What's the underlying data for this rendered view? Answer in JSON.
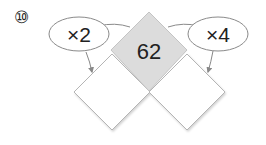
{
  "problem": {
    "number": "⑩",
    "top_value": "62",
    "left_operator": "×2",
    "right_operator": "×4",
    "left_answer": "",
    "right_answer": ""
  },
  "colors": {
    "top_fill": "#dcdcdc",
    "box_fill": "#ffffff",
    "stroke": "#9a9a9a",
    "text": "#222222"
  }
}
